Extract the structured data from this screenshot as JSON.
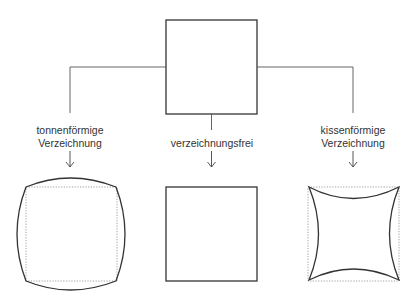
{
  "diagram": {
    "source_shape": "square",
    "branches": [
      {
        "id": "barrel",
        "label_line1": "tonnenförmige",
        "label_line2": "Verzeichnung",
        "shape": "barrel-distorted square"
      },
      {
        "id": "none",
        "label_line1": "verzeichnungsfrei",
        "label_line2": "",
        "shape": "undistorted square"
      },
      {
        "id": "pincushion",
        "label_line1": "kissenförmige",
        "label_line2": "Verzeichnung",
        "shape": "pincushion-distorted square"
      }
    ],
    "colors": {
      "stroke": "#333333",
      "dotted_reference": "#777777",
      "background": "#ffffff"
    }
  }
}
